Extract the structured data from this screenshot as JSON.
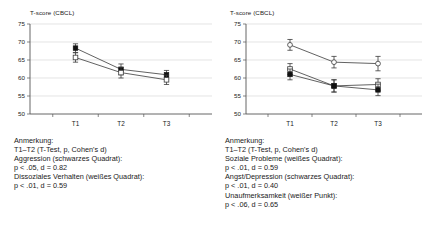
{
  "figure": {
    "panels": [
      {
        "id": "left",
        "axis_title": "T-score (CBCL)",
        "caption": [
          "Anmerkung:",
          "T1–T2 (T-Test, p, Cohen's d)",
          "Aggression (schwarzes Quadrat):",
          "p < .05, d = 0.82",
          "Dissoziales Verhalten (weißes Quadrat):",
          "p < .01, d = 0.59"
        ],
        "chart_data": {
          "type": "line",
          "title": "",
          "xlabel": "",
          "ylabel": "T-score (CBCL)",
          "categories": [
            "T1",
            "T2",
            "T3"
          ],
          "x": [
            1,
            2,
            3
          ],
          "ylim": [
            50,
            75
          ],
          "yticks": [
            50,
            55,
            60,
            65,
            70,
            75
          ],
          "grid": true,
          "legend": "none",
          "series": [
            {
              "name": "Aggression",
              "marker": "filled-square",
              "values": [
                68.3,
                62.4,
                60.9
              ],
              "err_low": [
                1.2,
                1.5,
                1.2
              ],
              "err_high": [
                1.2,
                1.5,
                1.2
              ]
            },
            {
              "name": "Dissoziales Verhalten",
              "marker": "open-square",
              "values": [
                65.7,
                61.5,
                59.5
              ],
              "err_low": [
                1.3,
                1.5,
                1.3
              ],
              "err_high": [
                1.3,
                1.5,
                1.3
              ]
            }
          ]
        }
      },
      {
        "id": "right",
        "axis_title": "T-score (CBCL)",
        "caption": [
          "Anmerkung:",
          "T1–T2 (T-Test, p, Cohen's d)",
          "Soziale Probleme (weißes Quadrat):",
          "p < .01, d = 0.59",
          "Angst/Depression (schwarzes Quadrat):",
          "p < .01, d = 0.40",
          "Unaufmerksamkeit (weißer Punkt):",
          "p < .06, d = 0.65"
        ],
        "chart_data": {
          "type": "line",
          "title": "",
          "xlabel": "",
          "ylabel": "T-score (CBCL)",
          "categories": [
            "T1",
            "T2",
            "T3"
          ],
          "x": [
            1,
            2,
            3
          ],
          "ylim": [
            50,
            75
          ],
          "yticks": [
            50,
            55,
            60,
            65,
            70,
            75
          ],
          "grid": true,
          "legend": "none",
          "series": [
            {
              "name": "Unaufmerksamkeit",
              "marker": "open-circle",
              "values": [
                69.2,
                64.4,
                64.0
              ],
              "err_low": [
                1.5,
                1.6,
                2.0
              ],
              "err_high": [
                1.5,
                1.6,
                2.0
              ]
            },
            {
              "name": "Soziale Probleme",
              "marker": "open-square",
              "values": [
                62.5,
                57.8,
                58.2
              ],
              "err_low": [
                1.5,
                1.7,
                1.6
              ],
              "err_high": [
                1.5,
                1.7,
                1.6
              ]
            },
            {
              "name": "Angst/Depression",
              "marker": "filled-square",
              "values": [
                61.0,
                57.8,
                56.7
              ],
              "err_low": [
                1.5,
                1.7,
                1.6
              ],
              "err_high": [
                1.5,
                1.7,
                1.6
              ]
            }
          ]
        }
      }
    ],
    "colors": {
      "axis": "#555555",
      "grid": "#d8d8d8",
      "series_line": "#3a3a3a",
      "marker_fill_dark": "#111111",
      "marker_fill_light": "#ffffff",
      "text": "#1a1a1a",
      "background": "#ffffff"
    }
  }
}
